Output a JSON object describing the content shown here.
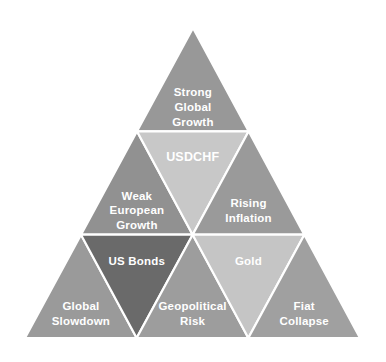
{
  "diagram": {
    "type": "triangle-hierarchy",
    "background_color": "#ffffff",
    "separator_color": "#ffffff",
    "label_color": "#ffffff",
    "rows": 3,
    "cells": [
      {
        "id": "strong-global-growth",
        "label_lines": [
          "Strong",
          "Global",
          "Growth"
        ],
        "orientation": "up",
        "row": 1,
        "column": 1,
        "fill": "#989898",
        "font_size": 11.5
      },
      {
        "id": "weak-european-growth",
        "label_lines": [
          "Weak",
          "European",
          "Growth"
        ],
        "orientation": "up",
        "row": 2,
        "column": 1,
        "fill": "#919191",
        "font_size": 11.5
      },
      {
        "id": "usdchf",
        "label_lines": [
          "USDCHF"
        ],
        "orientation": "down",
        "row": 2,
        "column": 2,
        "fill": "#c8c8c8",
        "font_size": 12.5
      },
      {
        "id": "rising-inflation",
        "label_lines": [
          "Rising",
          "Inflation"
        ],
        "orientation": "up",
        "row": 2,
        "column": 3,
        "fill": "#9a9a9a",
        "font_size": 11.5
      },
      {
        "id": "global-slowdown",
        "label_lines": [
          "Global",
          "Slowdown"
        ],
        "orientation": "up",
        "row": 3,
        "column": 1,
        "fill": "#9a9a9a",
        "font_size": 11.5
      },
      {
        "id": "us-bonds",
        "label_lines": [
          "US Bonds"
        ],
        "orientation": "down",
        "row": 3,
        "column": 2,
        "fill": "#6a6a6a",
        "font_size": 11.5
      },
      {
        "id": "geopolitical-risk",
        "label_lines": [
          "Geopolitical",
          "Risk"
        ],
        "orientation": "up",
        "row": 3,
        "column": 3,
        "fill": "#9d9d9d",
        "font_size": 11.5
      },
      {
        "id": "gold",
        "label_lines": [
          "Gold"
        ],
        "orientation": "down",
        "row": 3,
        "column": 4,
        "fill": "#c5c5c5",
        "font_size": 11.5
      },
      {
        "id": "fiat-collapse",
        "label_lines": [
          "Fiat",
          "Collapse"
        ],
        "orientation": "up",
        "row": 3,
        "column": 5,
        "fill": "#a0a0a0",
        "font_size": 11.5
      }
    ],
    "geometry": {
      "apex_x": 193,
      "apex_y": 28,
      "base_left_x": 25,
      "base_right_x": 360,
      "base_y": 338
    }
  }
}
